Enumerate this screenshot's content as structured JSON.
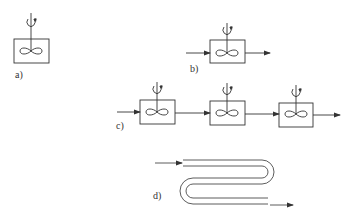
{
  "figure": {
    "type": "reactor-configurations",
    "colors": {
      "stroke": "#333333",
      "background": "#ffffff"
    },
    "panels": [
      {
        "id": "a",
        "label": "a)",
        "description": "single stirred tank (batch)",
        "tanks": 1,
        "inlet": false,
        "outlet": false
      },
      {
        "id": "b",
        "label": "b)",
        "description": "continuous stirred tank reactor",
        "tanks": 1,
        "inlet": true,
        "outlet": true
      },
      {
        "id": "c",
        "label": "c)",
        "description": "cascade of stirred tanks",
        "tanks": 3,
        "inlet": true,
        "outlet": true
      },
      {
        "id": "d",
        "label": "d)",
        "description": "tubular (serpentine) reactor",
        "tanks": 0,
        "inlet": true,
        "outlet": true
      }
    ],
    "icons": [
      "stirrer-icon",
      "rotation-arrow-icon",
      "flow-arrow-icon",
      "tank-icon",
      "serpentine-tube-icon"
    ]
  }
}
